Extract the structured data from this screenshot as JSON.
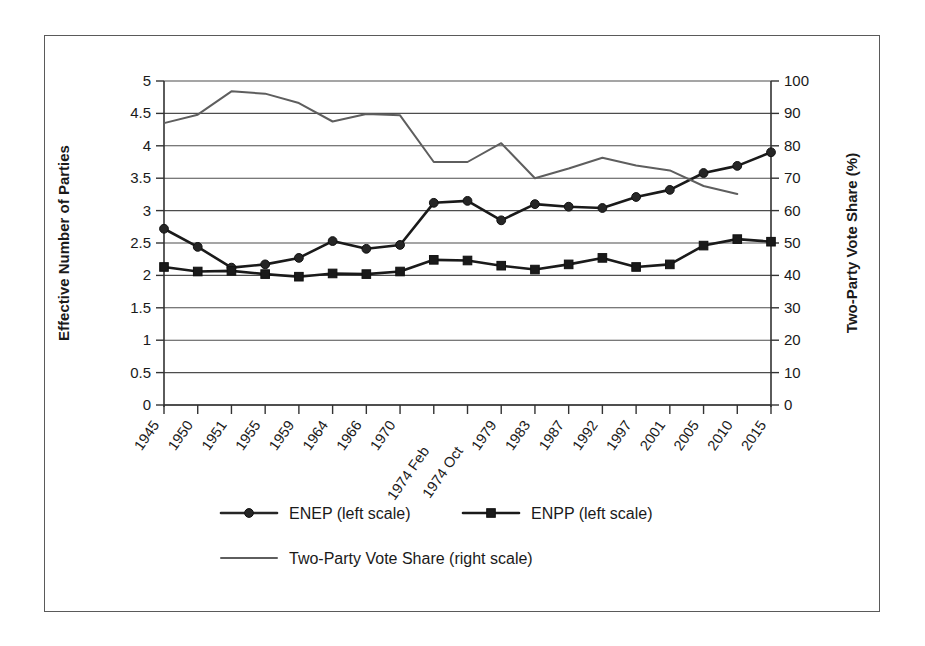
{
  "chart_data": {
    "type": "line",
    "title": "",
    "xlabel": "",
    "ylabel": "Effective Number of Parties",
    "y2label": "Two-Party Vote Share (%)",
    "ylim": [
      0,
      5
    ],
    "y2lim": [
      0,
      100
    ],
    "yticks": [
      "0",
      "0.5",
      "1",
      "1.5",
      "2",
      "2.5",
      "3",
      "3.5",
      "4",
      "4.5",
      "5"
    ],
    "ytick_values": [
      0,
      0.5,
      1,
      1.5,
      2,
      2.5,
      3,
      3.5,
      4,
      4.5,
      5
    ],
    "y2ticks": [
      "0",
      "10",
      "20",
      "30",
      "40",
      "50",
      "60",
      "70",
      "80",
      "90",
      "100"
    ],
    "y2tick_values": [
      0,
      10,
      20,
      30,
      40,
      50,
      60,
      70,
      80,
      90,
      100
    ],
    "grid": true,
    "legend_position": "bottom",
    "categories": [
      "1945",
      "1950",
      "1951",
      "1955",
      "1959",
      "1964",
      "1966",
      "1970",
      "1974 Feb",
      "1974 Oct",
      "1979",
      "1983",
      "1987",
      "1992",
      "1997",
      "2001",
      "2005",
      "2010",
      "2015"
    ],
    "series": [
      {
        "name": "ENEP (left scale)",
        "axis": "left",
        "marker": "circle",
        "color": "#262626",
        "values": [
          2.72,
          2.44,
          2.12,
          2.17,
          2.27,
          2.53,
          2.41,
          2.47,
          3.12,
          3.15,
          2.85,
          3.1,
          3.06,
          3.04,
          3.21,
          3.32,
          3.58,
          3.69,
          3.9
        ]
      },
      {
        "name": "ENPP (left scale)",
        "axis": "left",
        "marker": "square",
        "color": "#1a1a1a",
        "values": [
          2.13,
          2.06,
          2.07,
          2.02,
          1.98,
          2.03,
          2.02,
          2.06,
          2.24,
          2.23,
          2.15,
          2.09,
          2.17,
          2.27,
          2.13,
          2.17,
          2.46,
          2.56,
          2.52
        ]
      },
      {
        "name": "Two-Party Vote Share (right scale)",
        "axis": "right",
        "marker": "none",
        "color": "#5e5e5e",
        "values": [
          87.0,
          89.6,
          96.8,
          96.1,
          93.2,
          87.5,
          89.8,
          89.4,
          75.0,
          75.0,
          80.8,
          70.0,
          73.0,
          76.3,
          73.9,
          72.4,
          67.6,
          65.1,
          null
        ]
      }
    ],
    "legend": [
      {
        "label": "ENEP (left scale)",
        "marker": "circle"
      },
      {
        "label": "ENPP (left scale)",
        "marker": "square"
      },
      {
        "label": "Two-Party Vote Share (right scale)",
        "marker": "line"
      }
    ]
  }
}
